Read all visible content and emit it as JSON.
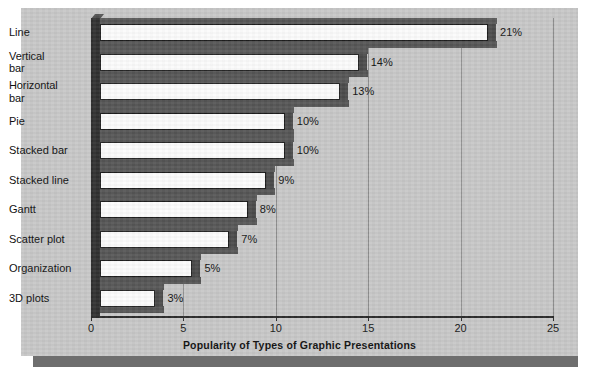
{
  "chart_data": {
    "type": "bar",
    "orientation": "horizontal",
    "title": "",
    "xlabel": "Popularity of Types of Graphic Presentations",
    "ylabel": "",
    "xlim": [
      0,
      25
    ],
    "xticks": [
      0,
      5,
      10,
      15,
      20,
      25
    ],
    "xtick_labels": [
      "0",
      "5",
      "10",
      "15",
      "20",
      "25"
    ],
    "grid": true,
    "grid_axis": "x",
    "legend": false,
    "style": "3d-horizontal-bar",
    "categories": [
      "Line",
      "Vertical bar",
      "Horizontal bar",
      "Pie",
      "Stacked bar",
      "Stacked line",
      "Gantt",
      "Scatter plot",
      "Organization",
      "3D plots"
    ],
    "values": [
      21,
      14,
      13,
      10,
      10,
      9,
      8,
      7,
      5,
      3
    ],
    "value_labels": [
      "21%",
      "14%",
      "13%",
      "10%",
      "10%",
      "9%",
      "8%",
      "7%",
      "5%",
      "3%"
    ],
    "category_label_lines": [
      [
        "Line"
      ],
      [
        "Vertical",
        "bar"
      ],
      [
        "Horizontal",
        "bar"
      ],
      [
        "Pie"
      ],
      [
        "Stacked bar"
      ],
      [
        "Stacked line"
      ],
      [
        "Gantt"
      ],
      [
        "Scatter plot"
      ],
      [
        "Organization"
      ],
      [
        "3D plots"
      ]
    ]
  },
  "colors": {
    "panel_background": "#c7c7c7",
    "panel_shadow": "#6e6e6e",
    "page_background": "#ffffff",
    "bar_face": "#fbfbfb",
    "bar_depth": "#4f4f4f",
    "axis": "#2e2e2e",
    "gridline": "#8e8e8e",
    "text": "#111111"
  }
}
